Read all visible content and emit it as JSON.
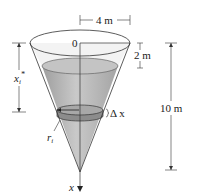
{
  "figure": {
    "labels": {
      "top_width": "4 m",
      "origin": "0",
      "gap_to_water": "2 m",
      "height": "10 m",
      "depth_var": "x",
      "depth_sub": "i",
      "depth_star": "*",
      "radius_var": "r",
      "radius_sub": "i",
      "thickness": "Δ x",
      "axis": "x"
    },
    "colors": {
      "water": "#b8b8b8",
      "water_dark": "#9a9a9a",
      "cone_empty": "#ececec",
      "line": "#333333"
    }
  }
}
